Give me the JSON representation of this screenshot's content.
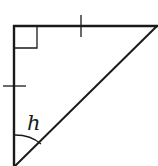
{
  "diagram": {
    "type": "right-triangle",
    "angle_label": "h",
    "right_angle_marker": true,
    "congruence_ticks": [
      "top-leg",
      "left-leg"
    ],
    "stroke_color": "#1a1a1a",
    "background": "#ffffff"
  }
}
